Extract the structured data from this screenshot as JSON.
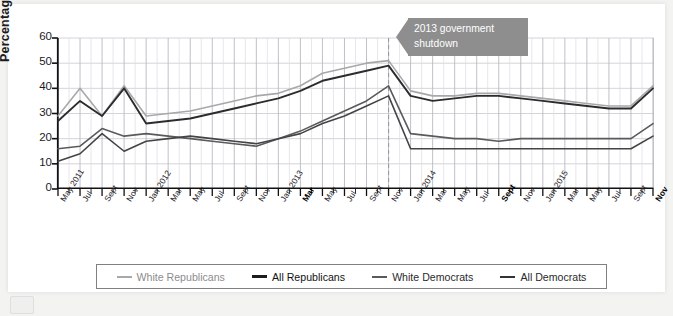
{
  "figure": {
    "callout": {
      "line1": "2013 government",
      "line2": "shutdown",
      "full_text": "2013 government shutdown",
      "bg_color": "#8e8e8e",
      "text_color": "#ffffff"
    }
  },
  "chart_data": {
    "type": "line",
    "title": "",
    "xlabel": "",
    "ylabel": "Percentage",
    "ylim": [
      0,
      60
    ],
    "yticks": [
      0,
      10,
      20,
      30,
      40,
      50,
      60
    ],
    "grid": true,
    "grid_axis": "both",
    "legend_position": "bottom",
    "annotations": [
      {
        "text": "2013 government shutdown",
        "x": "Nov 2013",
        "type": "callout-banner",
        "marker": "dashed-vertical-line"
      }
    ],
    "x": [
      "May 2011",
      "Jul",
      "Sept",
      "Nov",
      "Jan 2012",
      "Mar",
      "May",
      "Jul",
      "Sept",
      "Nov",
      "Jan 2013",
      "Mar",
      "May",
      "Jul",
      "Sept",
      "Nov",
      "Jan 2014",
      "Mar",
      "May",
      "Jul",
      "Sept",
      "Nov",
      "Jan 2015",
      "Mar",
      "May",
      "Jul",
      "Sept",
      "Nov"
    ],
    "x_bold_labels": [
      "Mar",
      "Sept",
      "Nov"
    ],
    "x_bold_indices": [
      11,
      20,
      27
    ],
    "series": [
      {
        "name": "White Republicans",
        "color": "#a8a8a8",
        "width": 1.6,
        "values": [
          29,
          40,
          29,
          41,
          29,
          30,
          31,
          33,
          35,
          37,
          38,
          41,
          46,
          48,
          50,
          51,
          39,
          37,
          37,
          38,
          38,
          37,
          36,
          35,
          34,
          33,
          33,
          41
        ]
      },
      {
        "name": "All Republicans",
        "color": "#2c2c2c",
        "width": 1.9,
        "values": [
          27,
          35,
          29,
          40,
          26,
          27,
          28,
          30,
          32,
          34,
          36,
          39,
          43,
          45,
          47,
          49,
          37,
          35,
          36,
          37,
          37,
          36,
          35,
          34,
          33,
          32,
          32,
          40
        ]
      },
      {
        "name": "White Democrats",
        "color": "#5a5a5a",
        "width": 1.6,
        "values": [
          16,
          17,
          24,
          21,
          22,
          21,
          20,
          19,
          18,
          17,
          20,
          23,
          27,
          31,
          35,
          41,
          22,
          21,
          20,
          20,
          19,
          20,
          20,
          20,
          20,
          20,
          20,
          26
        ]
      },
      {
        "name": "All Democrats",
        "color": "#444444",
        "width": 1.6,
        "values": [
          11,
          14,
          22,
          15,
          19,
          20,
          21,
          20,
          19,
          18,
          20,
          22,
          26,
          29,
          33,
          37,
          16,
          16,
          16,
          16,
          16,
          16,
          16,
          16,
          16,
          16,
          16,
          21
        ]
      }
    ]
  },
  "legend": {
    "items": [
      {
        "label": "White Republicans",
        "color": "#a8a8a8",
        "width": 2.4
      },
      {
        "label": "All Republicans",
        "color": "#1c1c1c",
        "width": 3.2
      },
      {
        "label": "White Democrats",
        "color": "#5a5a5a",
        "width": 2.4
      },
      {
        "label": "All Democrats",
        "color": "#333333",
        "width": 2.8
      }
    ]
  }
}
